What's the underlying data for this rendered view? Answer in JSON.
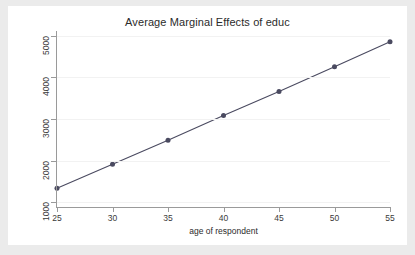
{
  "chart_data": {
    "type": "line",
    "title": "Average Marginal Effects of educ",
    "xlabel": "age of respondent",
    "ylabel": "Effects on Linear Prediction",
    "x": [
      25,
      30,
      35,
      40,
      45,
      50,
      55
    ],
    "values": [
      1340,
      1915,
      2490,
      3085,
      3660,
      4255,
      4855
    ],
    "series": [
      {
        "name": "Average marginal effect of educ",
        "x": [
          25,
          30,
          35,
          40,
          45,
          50,
          55
        ],
        "values": [
          1340,
          1915,
          2490,
          3085,
          3660,
          4255,
          4855
        ]
      }
    ],
    "xlim": [
      25,
      55
    ],
    "ylim": [
      890,
      5110
    ],
    "xticks": [
      25,
      30,
      35,
      40,
      45,
      50,
      55
    ],
    "yticks": [
      1000,
      2000,
      3000,
      4000,
      5000
    ],
    "xtick_labels": [
      "25",
      "30",
      "35",
      "40",
      "45",
      "50",
      "55"
    ],
    "ytick_labels": [
      "1000",
      "2000",
      "3000",
      "4000",
      "5000"
    ],
    "grid": "horizontal",
    "legend": "none",
    "line_color": "#4a4a60",
    "marker_color": "#4a4a60",
    "marker": "circle",
    "plot_bgcolor": "#ffffff",
    "figure_bgcolor": "#ebebeb"
  },
  "figure": {
    "title": "Average Marginal Effects of educ",
    "x_axis_title": "age of respondent",
    "y_axis_title": "Effects on Linear Prediction"
  }
}
